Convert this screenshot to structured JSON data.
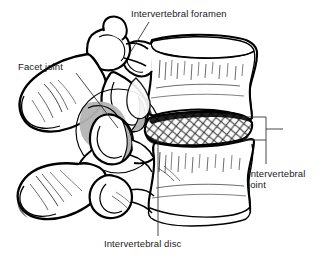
{
  "figure": {
    "width": 322,
    "height": 264,
    "background_color": "#ffffff",
    "line_color": "#000000",
    "shading_color": "#b3b3b3",
    "hatch_color": "#4d4d4d",
    "leader_color": "#333333"
  },
  "labels": {
    "intervertebral_foramen": "Intervertebral foramen",
    "facet_joint": "Facet joint",
    "intervertebral_disc": "Intervertebral disc",
    "intervertebral_joint": "Intervertebral\njoint"
  },
  "structures": [
    {
      "name": "superior-vertebral-body",
      "description": "Upper vertebral body, concave anterior wall"
    },
    {
      "name": "inferior-vertebral-body",
      "description": "Lower vertebral body, concave anterior wall"
    },
    {
      "name": "intervertebral-disc",
      "description": "Cross-hatched fibrous disc between the bodies"
    },
    {
      "name": "superior-spinous-process",
      "description": "Posterior bony projection of upper vertebra"
    },
    {
      "name": "inferior-spinous-process",
      "description": "Posterior bony projection of lower vertebra"
    },
    {
      "name": "facet-joint-region",
      "description": "Gray-shaded zygapophysial articulation, circled"
    },
    {
      "name": "intervertebral-foramen",
      "description": "Opening between pedicles for the spinal nerve"
    },
    {
      "name": "intervertebral-joint-bracket",
      "description": "Right-side bracket spanning the disc"
    }
  ]
}
